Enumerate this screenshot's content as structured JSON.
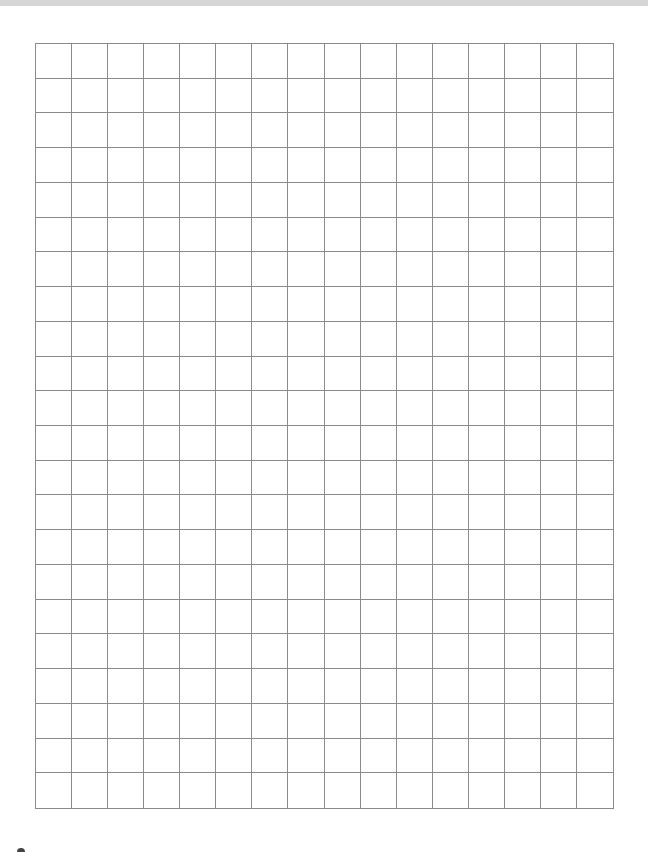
{
  "document": {
    "type": "graph-paper",
    "grid": {
      "columns": 16,
      "rows": 22,
      "line_color": "#8a8a8a",
      "background": "#ffffff"
    }
  },
  "colors": {
    "top_strip": "#d6d6d6",
    "corner_mark": "#444444"
  }
}
